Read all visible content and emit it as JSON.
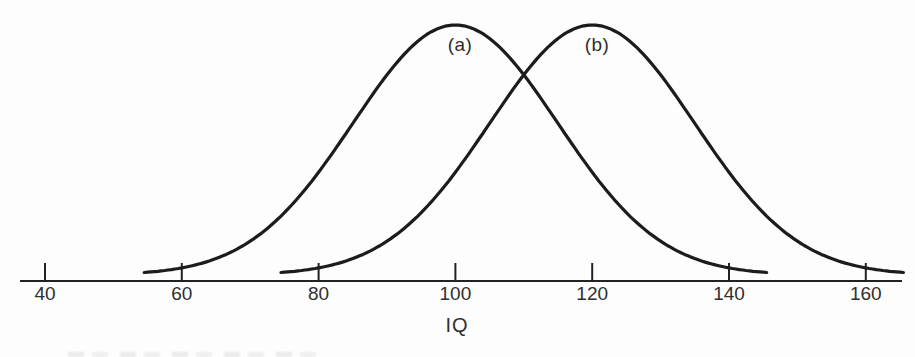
{
  "figure": {
    "background_color": "#fdfdfd",
    "curve_color": "#1c1c1c",
    "axis_color": "#222222",
    "text_color": "#2f2f2f",
    "curve_a_label": "(a)",
    "curve_b_label": "(b)",
    "x_axis_label": "IQ"
  },
  "chart_data": {
    "type": "line",
    "title": "",
    "subtitle": "",
    "xlabel": "IQ",
    "ylabel": "",
    "xlim": [
      36,
      166
    ],
    "x_ticks": [
      40,
      60,
      80,
      100,
      120,
      140,
      160
    ],
    "grid": false,
    "legend_position": "none",
    "series": [
      {
        "name": "(a)",
        "shape": "normal-distribution",
        "mean": 100,
        "sd": 15,
        "x_range": [
          54.5,
          145.5
        ],
        "peak_x": 100
      },
      {
        "name": "(b)",
        "shape": "normal-distribution",
        "mean": 120,
        "sd": 15,
        "x_range": [
          74.5,
          165.5
        ],
        "peak_x": 120
      }
    ],
    "annotations": [
      {
        "text": "(a)",
        "attached_to": "curve-a",
        "position": "inside-below-peak"
      },
      {
        "text": "(b)",
        "attached_to": "curve-b",
        "position": "inside-below-peak"
      }
    ]
  }
}
